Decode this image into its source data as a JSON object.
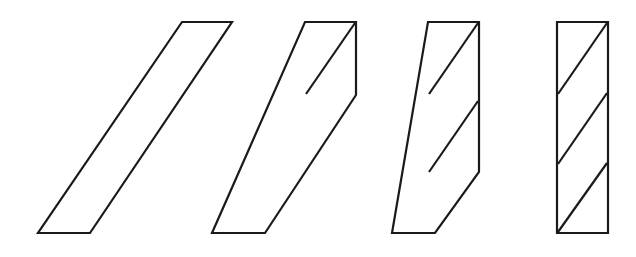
{
  "figure": {
    "background_color": "#ffffff",
    "stroke_color": "#1a1a1a",
    "fill_color": "#ffffff",
    "stroke_width": 2.2,
    "canvas": {
      "width": 636,
      "height": 257
    },
    "common_geometry": {
      "top_y": 22,
      "bottom_y": 233,
      "bar_height": 211,
      "bar_width": 50,
      "slant_run": 50,
      "stripe_pitch": 70
    },
    "shapes": [
      {
        "index": 1,
        "name": "parallelogram-no-stripes",
        "label": "Shape 1",
        "stripe_count": 0,
        "upright_portion": 0,
        "outline_points": "182,22 232,22 90,233 38,233",
        "stripes": []
      },
      {
        "index": 2,
        "name": "bar-one-stripe",
        "label": "Shape 2",
        "stripe_count": 1,
        "upright_portion": 73,
        "outline_points": "305,22 356,22 356,95 265,233 212,233",
        "stripes": [
          "306,94 355,23"
        ]
      },
      {
        "index": 3,
        "name": "bar-two-stripes",
        "label": "Shape 3",
        "stripe_count": 2,
        "upright_portion": 150,
        "outline_points": "428,22 479,22 479,172 435,233 392,233",
        "stripes": [
          "429,94 478,23",
          "429,172 478,101"
        ]
      },
      {
        "index": 4,
        "name": "rectangle-three-stripes",
        "label": "Shape 4",
        "stripe_count": 3,
        "upright_portion": 211,
        "outline_points": "557,22 608,22 608,233 557,233",
        "stripes": [
          "558,94 607,23",
          "558,164 607,93",
          "558,232 607,163"
        ]
      }
    ]
  }
}
